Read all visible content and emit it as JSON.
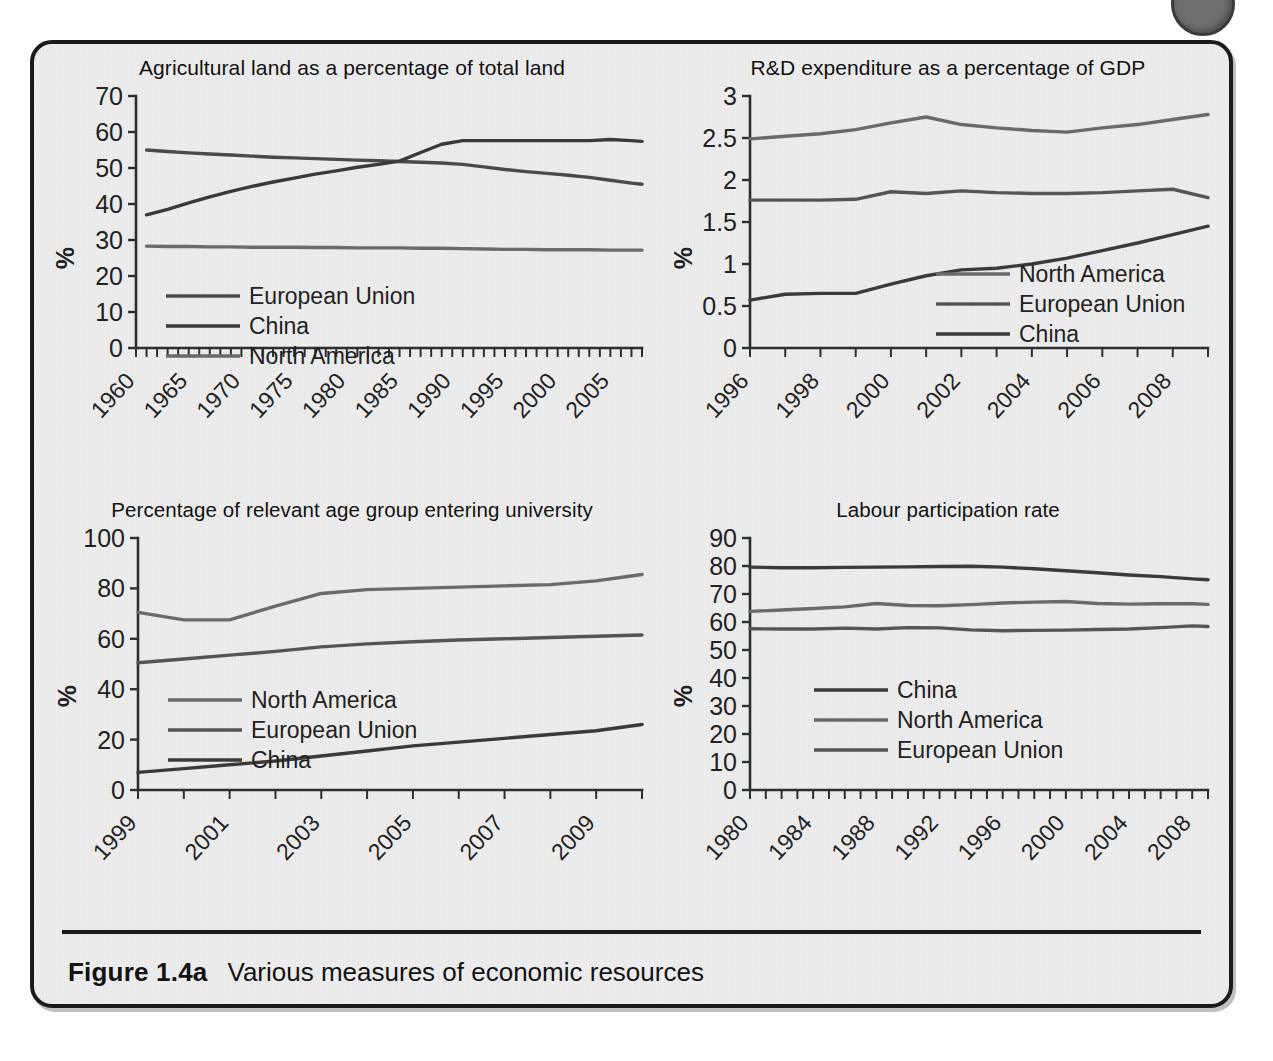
{
  "figure": {
    "number_label": "Figure 1.4a",
    "caption": "Various measures of economic resources"
  },
  "colors": {
    "paper": "#ededed",
    "ink": "#3c3c3c",
    "border": "#1b1b1b",
    "series_dark": "#404040",
    "series_mid": "#585858",
    "series_light": "#6f6f6f"
  },
  "chart_data": [
    {
      "id": "agricultural-land",
      "type": "line",
      "title": "Agricultural land as a percentage of total land",
      "xlabel": "",
      "ylabel": "%",
      "ylim": [
        0,
        70
      ],
      "yticks": [
        0,
        10,
        20,
        30,
        40,
        50,
        60,
        70
      ],
      "xlim": [
        1960,
        2008
      ],
      "xticks": [
        1960,
        1965,
        1970,
        1975,
        1980,
        1985,
        1990,
        1995,
        2000,
        2005
      ],
      "minor_tick_step": 1,
      "grid": false,
      "legend_position": "inside-left-lower",
      "x": [
        1961,
        1963,
        1965,
        1967,
        1969,
        1971,
        1973,
        1975,
        1977,
        1979,
        1981,
        1983,
        1985,
        1987,
        1989,
        1991,
        1993,
        1995,
        1997,
        1999,
        2001,
        2003,
        2005,
        2007,
        2008
      ],
      "series": [
        {
          "name": "European Union",
          "color": "#4a4a4a",
          "values": [
            55.0,
            54.6,
            54.2,
            53.9,
            53.6,
            53.3,
            53.0,
            52.8,
            52.6,
            52.4,
            52.2,
            52.0,
            51.8,
            51.6,
            51.4,
            51.0,
            50.3,
            49.6,
            49.0,
            48.5,
            48.0,
            47.4,
            46.6,
            45.8,
            45.5
          ]
        },
        {
          "name": "China",
          "color": "#3a3a3a",
          "values": [
            37.0,
            38.5,
            40.3,
            42.0,
            43.5,
            44.9,
            46.1,
            47.2,
            48.3,
            49.2,
            50.2,
            51.0,
            51.9,
            54.3,
            56.6,
            57.6,
            57.6,
            57.6,
            57.6,
            57.6,
            57.6,
            57.6,
            57.9,
            57.6,
            57.4
          ]
        },
        {
          "name": "North America",
          "color": "#6a6a6a",
          "values": [
            28.3,
            28.2,
            28.2,
            28.1,
            28.1,
            28.0,
            28.0,
            28.0,
            27.9,
            27.9,
            27.8,
            27.8,
            27.8,
            27.7,
            27.7,
            27.6,
            27.5,
            27.4,
            27.4,
            27.3,
            27.3,
            27.3,
            27.2,
            27.2,
            27.2
          ]
        }
      ]
    },
    {
      "id": "rd-expenditure",
      "type": "line",
      "title": "R&D expenditure as a percentage of GDP",
      "xlabel": "",
      "ylabel": "%",
      "ylim": [
        0,
        3
      ],
      "yticks": [
        0,
        0.5,
        1,
        1.5,
        2,
        2.5,
        3
      ],
      "xlim": [
        1996,
        2009
      ],
      "xticks": [
        1996,
        1998,
        2000,
        2002,
        2004,
        2006,
        2008
      ],
      "minor_tick_step": 1,
      "grid": false,
      "legend_position": "inside-right-middle",
      "x": [
        1996,
        1997,
        1998,
        1999,
        2000,
        2001,
        2002,
        2003,
        2004,
        2005,
        2006,
        2007,
        2008,
        2009
      ],
      "series": [
        {
          "name": "North America",
          "color": "#6a6a6a",
          "values": [
            2.49,
            2.52,
            2.55,
            2.6,
            2.68,
            2.75,
            2.66,
            2.62,
            2.59,
            2.57,
            2.62,
            2.66,
            2.72,
            2.78
          ]
        },
        {
          "name": "European Union",
          "color": "#555555",
          "values": [
            1.76,
            1.76,
            1.76,
            1.77,
            1.86,
            1.84,
            1.87,
            1.85,
            1.84,
            1.84,
            1.85,
            1.87,
            1.89,
            1.79
          ]
        },
        {
          "name": "China",
          "color": "#3a3a3a",
          "values": [
            0.57,
            0.64,
            0.65,
            0.65,
            0.76,
            0.86,
            0.93,
            0.95,
            1.0,
            1.07,
            1.16,
            1.25,
            1.35,
            1.45
          ]
        }
      ]
    },
    {
      "id": "university-entry",
      "type": "line",
      "title": "Percentage of relevant age group entering university",
      "xlabel": "",
      "ylabel": "%",
      "ylim": [
        0,
        100
      ],
      "yticks": [
        0,
        20,
        40,
        60,
        80,
        100
      ],
      "xlim": [
        1999,
        2010
      ],
      "xticks": [
        1999,
        2001,
        2003,
        2005,
        2007,
        2009
      ],
      "minor_tick_step": 1,
      "grid": false,
      "legend_position": "inside-left-lower",
      "x": [
        1999,
        2000,
        2001,
        2002,
        2003,
        2004,
        2005,
        2006,
        2007,
        2008,
        2009,
        2010
      ],
      "series": [
        {
          "name": "North America",
          "color": "#6a6a6a",
          "values": [
            70.5,
            67.5,
            67.5,
            73.0,
            78.0,
            79.5,
            80.0,
            80.5,
            81.0,
            81.5,
            83.0,
            85.5
          ]
        },
        {
          "name": "European Union",
          "color": "#555555",
          "values": [
            50.5,
            52.0,
            53.5,
            55.0,
            56.8,
            58.0,
            58.8,
            59.5,
            60.0,
            60.5,
            61.0,
            61.5
          ]
        },
        {
          "name": "China",
          "color": "#3a3a3a",
          "values": [
            7.0,
            8.5,
            10.0,
            11.5,
            13.5,
            15.5,
            17.5,
            19.0,
            20.5,
            22.0,
            23.5,
            26.0
          ]
        }
      ]
    },
    {
      "id": "labour-participation",
      "type": "line",
      "title": "Labour participation rate",
      "xlabel": "",
      "ylabel": "%",
      "ylim": [
        0,
        90
      ],
      "yticks": [
        0,
        10,
        20,
        30,
        40,
        50,
        60,
        70,
        80,
        90
      ],
      "xlim": [
        1980,
        2009
      ],
      "xticks": [
        1980,
        1984,
        1988,
        1992,
        1996,
        2000,
        2004,
        2008
      ],
      "minor_tick_step": 1,
      "grid": false,
      "legend_position": "inside-left-middle",
      "x": [
        1980,
        1982,
        1984,
        1986,
        1988,
        1990,
        1992,
        1994,
        1996,
        1998,
        2000,
        2002,
        2004,
        2006,
        2008,
        2009
      ],
      "series": [
        {
          "name": "China",
          "color": "#3a3a3a",
          "values": [
            79.6,
            79.4,
            79.4,
            79.5,
            79.6,
            79.7,
            79.8,
            79.9,
            79.6,
            79.0,
            78.3,
            77.6,
            76.8,
            76.2,
            75.4,
            75.1
          ]
        },
        {
          "name": "North America",
          "color": "#6a6a6a",
          "values": [
            63.8,
            64.3,
            64.8,
            65.4,
            66.6,
            65.9,
            65.8,
            66.2,
            66.8,
            67.1,
            67.3,
            66.6,
            66.4,
            66.5,
            66.5,
            66.3
          ]
        },
        {
          "name": "European Union",
          "color": "#555555",
          "values": [
            57.6,
            57.5,
            57.5,
            57.8,
            57.5,
            58.0,
            57.9,
            57.2,
            56.9,
            57.0,
            57.1,
            57.3,
            57.5,
            58.0,
            58.6,
            58.4
          ]
        }
      ]
    }
  ]
}
